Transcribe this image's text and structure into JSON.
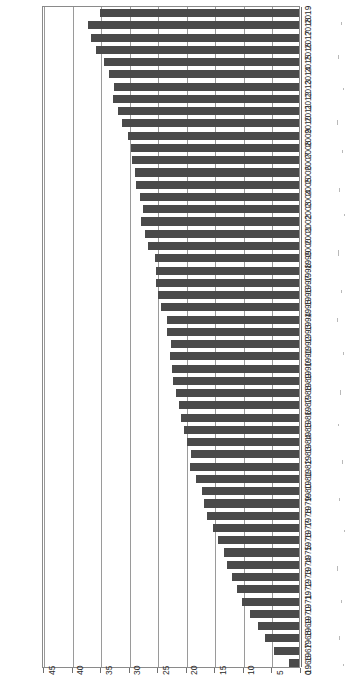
{
  "chart_data": {
    "type": "bar",
    "orientation": "horizontal",
    "title": "",
    "subtitle": "",
    "xlabel": "",
    "ylabel": "",
    "grid": true,
    "legend": null,
    "legend_position": "none",
    "bar_color": "#4a4a4a",
    "axis_color": "#8a8a8a",
    "value_axis": {
      "ticks": [
        45,
        40,
        35,
        30,
        25,
        20,
        15,
        10,
        5,
        0
      ],
      "tick_labels": [
        "45",
        "40",
        "35",
        "30",
        "25",
        "20",
        "15",
        "10",
        "5",
        "0"
      ],
      "min": 0,
      "max": 45,
      "direction": "right-to-left",
      "step": 5
    },
    "categories": [
      "2019",
      "2018",
      "2017",
      "2016",
      "2015",
      "2014",
      "2013",
      "2012",
      "2011",
      "2010",
      "2009",
      "2008",
      "2007",
      "2006",
      "2005",
      "2004",
      "2003",
      "2002",
      "2001",
      "2000",
      "1999",
      "1998",
      "1997",
      "1996",
      "1995",
      "1994",
      "1993",
      "1992",
      "1991",
      "1990",
      "1989",
      "1988",
      "1987",
      "1986",
      "1985",
      "1984",
      "1983",
      "1982",
      "1981",
      "1980",
      "1979",
      "1978",
      "1977",
      "1976",
      "1975",
      "1974",
      "1973",
      "1972",
      "1971",
      "1970",
      "1969",
      "1968",
      "1967",
      "1966"
    ],
    "values": [
      35.2,
      37.3,
      36.8,
      35.8,
      34.5,
      33.6,
      32.7,
      32.9,
      32.0,
      31.3,
      30.3,
      29.7,
      29.6,
      29.0,
      28.8,
      28.2,
      27.6,
      27.9,
      27.2,
      26.7,
      25.6,
      25.4,
      25.4,
      25.0,
      24.4,
      23.4,
      23.5,
      22.8,
      22.9,
      22.6,
      22.3,
      21.9,
      21.4,
      21.0,
      20.5,
      20.0,
      19.2,
      19.4,
      18.3,
      17.2,
      16.9,
      16.4,
      15.4,
      14.4,
      13.5,
      12.9,
      12.0,
      11.1,
      10.3,
      8.8,
      7.4,
      6.2,
      4.7,
      2.0
    ]
  }
}
